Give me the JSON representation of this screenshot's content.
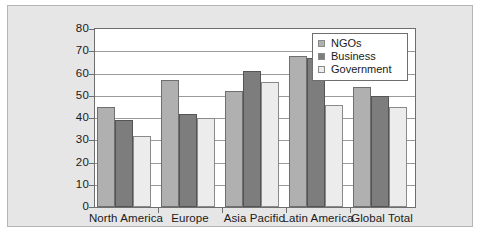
{
  "chart_data": {
    "type": "bar",
    "title": "",
    "subtitle": "",
    "xlabel": "",
    "ylabel": "",
    "ylim": [
      0,
      80
    ],
    "yticks": [
      0,
      10,
      20,
      30,
      40,
      50,
      60,
      70,
      80
    ],
    "grid": true,
    "legend_position": "upper-right-inside",
    "categories": [
      "North America",
      "Europe",
      "Asia Pacific",
      "Latin America",
      "Global Total"
    ],
    "series": [
      {
        "name": "NGOs",
        "color": "#b0b0b0",
        "values": [
          45,
          57,
          52,
          68,
          54
        ]
      },
      {
        "name": "Business",
        "color": "#7d7d7d",
        "values": [
          39,
          42,
          61,
          67,
          50
        ]
      },
      {
        "name": "Government",
        "color": "#ececec",
        "values": [
          32,
          40,
          56,
          46,
          45
        ]
      }
    ]
  },
  "colors": {
    "panel_background": "#e6e6e6",
    "plot_background": "#ffffff",
    "axis": "#6e6e6e",
    "gridline": "#9a9a9a",
    "text": "#1a1a1a"
  }
}
